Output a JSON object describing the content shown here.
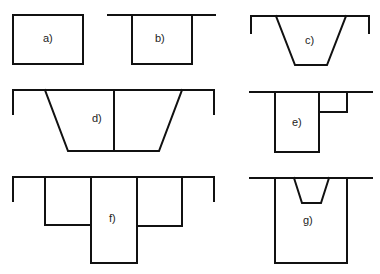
{
  "figure": {
    "panels": [
      {
        "id": "a",
        "label": "a)",
        "shape": "rectangle, free-standing"
      },
      {
        "id": "b",
        "label": "b)",
        "shape": "rectangle hanging below a horizontal line"
      },
      {
        "id": "c",
        "label": "c)",
        "shape": "trapezoid channel with side walls"
      },
      {
        "id": "d",
        "label": "d)",
        "shape": "trapezoid channel divided by vertical center line"
      },
      {
        "id": "e",
        "label": "e)",
        "shape": "rectangle with small side rectangle"
      },
      {
        "id": "f",
        "label": "f)",
        "shape": "stepped compound rectangle with side walls"
      },
      {
        "id": "g",
        "label": "g)",
        "shape": "rectangle with small trapezoid notch at top"
      }
    ],
    "stroke_color": "#111111",
    "background": "#ffffff"
  }
}
